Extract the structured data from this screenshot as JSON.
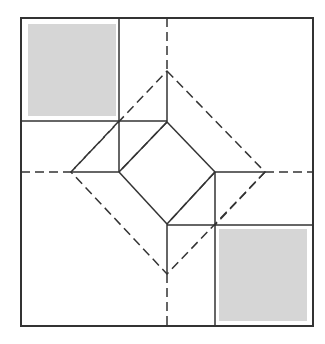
{
  "diagram": {
    "title": "",
    "colors": {
      "background": "#ffffff",
      "line": "#333333",
      "shade": "#d6d6d6"
    },
    "outer_square": {
      "x1": 21,
      "y1": 18,
      "x2": 313,
      "y2": 326
    },
    "shaded_squares": [
      {
        "id": "top-left",
        "x": 28,
        "y": 24,
        "w": 88,
        "h": 92
      },
      {
        "id": "bottom-right",
        "x": 219,
        "y": 229,
        "w": 88,
        "h": 92
      }
    ],
    "outer_dashed_diamond": [
      [
        167,
        71
      ],
      [
        265,
        172
      ],
      [
        167,
        274
      ],
      [
        71,
        172
      ]
    ],
    "inner_solid_diamond": [
      [
        167,
        122
      ],
      [
        215,
        172
      ],
      [
        167,
        224
      ],
      [
        119,
        172
      ]
    ]
  }
}
